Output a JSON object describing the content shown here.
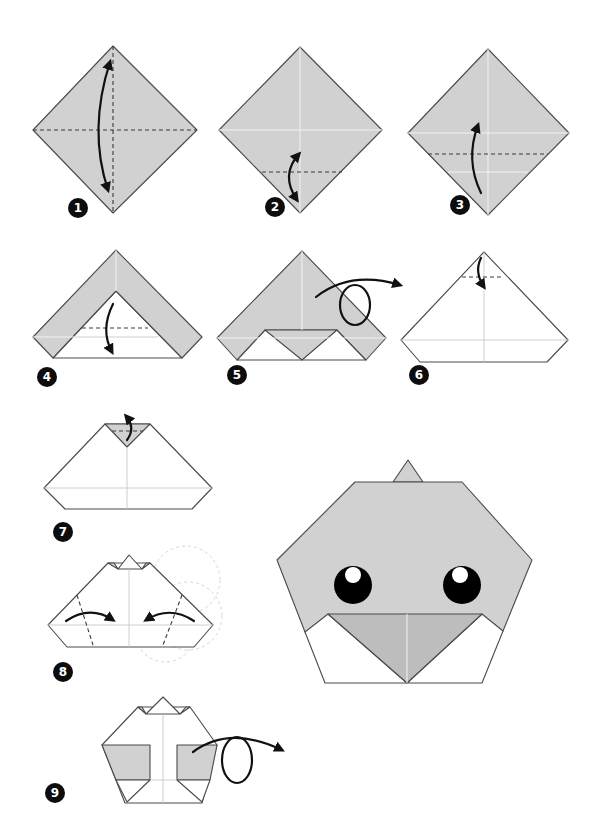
{
  "colors": {
    "paper_color": "#d1d1d1",
    "paper_back": "#ffffff",
    "outline": "#4a4a4a",
    "arrow": "#111111",
    "badge": "#0d0d0d",
    "eye": "#000000",
    "eye_highlight": "#ffffff"
  },
  "steps": [
    {
      "number": "1",
      "instruction_icons": [
        "valley-fold-vertical-dashed",
        "valley-fold-horizontal-dashed",
        "fold-and-unfold-arrow"
      ]
    },
    {
      "number": "2",
      "instruction_icons": [
        "valley-fold-dashed",
        "fold-and-unfold-arrow"
      ]
    },
    {
      "number": "3",
      "instruction_icons": [
        "valley-fold-dashed",
        "fold-up-arrow"
      ]
    },
    {
      "number": "4",
      "instruction_icons": [
        "valley-fold-dashed",
        "fold-down-arrow"
      ]
    },
    {
      "number": "5",
      "instruction_icons": [
        "turn-over-arrow"
      ]
    },
    {
      "number": "6",
      "instruction_icons": [
        "valley-fold-dashed",
        "fold-down-arrow"
      ]
    },
    {
      "number": "7",
      "instruction_icons": [
        "fold-back-arrow"
      ]
    },
    {
      "number": "8",
      "instruction_icons": [
        "valley-fold-dashed-left",
        "valley-fold-dashed-right",
        "fold-in-arrow-left",
        "fold-in-arrow-right"
      ]
    },
    {
      "number": "9",
      "instruction_icons": [
        "turn-over-arrow"
      ]
    }
  ],
  "result": {
    "label": "finished-chick-face",
    "features": [
      "crest",
      "two-eyes",
      "beak",
      "white-bib"
    ]
  }
}
